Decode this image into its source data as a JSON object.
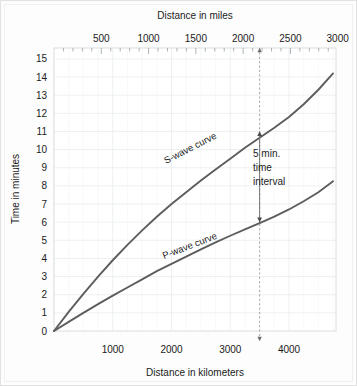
{
  "chart_data": {
    "type": "line",
    "title": "",
    "xlabel": "Distance in kilometers",
    "x2label": "Distance in miles",
    "ylabel": "Time in minutes",
    "xlim": [
      0,
      4800
    ],
    "ylim": [
      0,
      15.6
    ],
    "x2lim": [
      0,
      2982
    ],
    "grid": true,
    "legend": "inline-labels",
    "xticks": [
      1000,
      2000,
      3000,
      4000
    ],
    "xtick_labels": [
      "1000",
      "2000",
      "3000",
      "4000"
    ],
    "x2ticks": [
      500,
      1000,
      1500,
      2000,
      2500,
      3000
    ],
    "x2tick_labels": [
      "500",
      "1000",
      "1500",
      "2000",
      "2500",
      "3000"
    ],
    "yticks": [
      0,
      1,
      2,
      3,
      4,
      5,
      6,
      7,
      8,
      9,
      10,
      11,
      12,
      13,
      14,
      15
    ],
    "ytick_labels": [
      "0",
      "1",
      "2",
      "3",
      "4",
      "5",
      "6",
      "7",
      "8",
      "9",
      "10",
      "11",
      "12",
      "13",
      "14",
      "15"
    ],
    "series": [
      {
        "name": "S-wave curve",
        "label": "S-wave curve",
        "color": "#5d5d5d",
        "x": [
          0,
          250,
          500,
          750,
          1000,
          1250,
          1500,
          1750,
          2000,
          2250,
          2500,
          2750,
          3000,
          3250,
          3500,
          3750,
          4000,
          4250,
          4500,
          4750
        ],
        "y": [
          0,
          1.05,
          2.05,
          3.0,
          3.9,
          4.75,
          5.55,
          6.3,
          7.0,
          7.65,
          8.3,
          8.9,
          9.5,
          10.1,
          10.65,
          11.2,
          11.8,
          12.5,
          13.3,
          14.2
        ]
      },
      {
        "name": "P-wave curve",
        "label": "P-wave curve",
        "color": "#5d5d5d",
        "x": [
          0,
          250,
          500,
          750,
          1000,
          1250,
          1500,
          1750,
          2000,
          2250,
          2500,
          2750,
          3000,
          3250,
          3500,
          3750,
          4000,
          4250,
          4500,
          4750
        ],
        "y": [
          0,
          0.5,
          1.0,
          1.48,
          1.95,
          2.4,
          2.85,
          3.3,
          3.7,
          4.1,
          4.5,
          4.88,
          5.25,
          5.6,
          5.95,
          6.3,
          6.7,
          7.15,
          7.65,
          8.25
        ]
      }
    ],
    "annotations": [
      {
        "name": "time-interval",
        "text": "5 min.\ntime\ninterval",
        "lines": [
          "5 min.",
          "time",
          "interval"
        ],
        "x": 3500,
        "y_from": 6.0,
        "y_to": 11.0,
        "value_minutes": 5
      },
      {
        "name": "reference-distance-line",
        "x": 3500,
        "style": "dashed-vertical"
      }
    ]
  }
}
